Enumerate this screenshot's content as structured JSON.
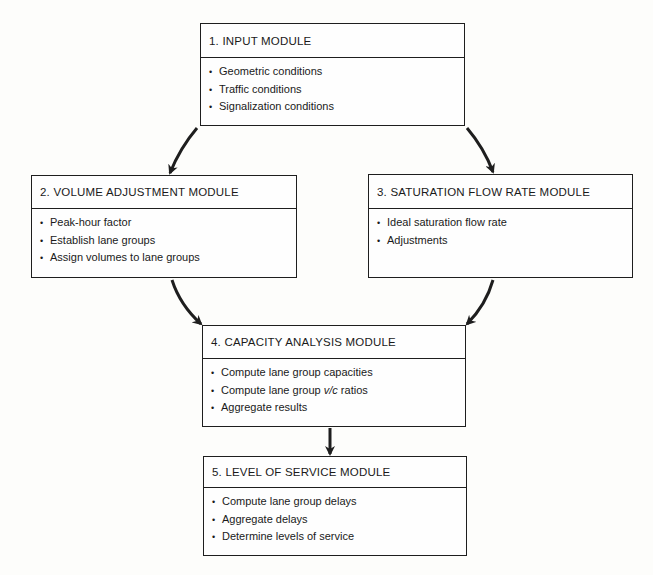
{
  "diagram": {
    "modules": [
      {
        "id": "input",
        "title": "1. INPUT MODULE",
        "items": [
          "Geometric conditions",
          "Traffic conditions",
          "Signalization conditions"
        ]
      },
      {
        "id": "volume-adjustment",
        "title": "2. VOLUME ADJUSTMENT MODULE",
        "items": [
          "Peak-hour factor",
          "Establish lane groups",
          "Assign volumes to lane groups"
        ]
      },
      {
        "id": "saturation-flow-rate",
        "title": "3. SATURATION FLOW RATE MODULE",
        "items": [
          "Ideal saturation flow rate",
          "Adjustments"
        ]
      },
      {
        "id": "capacity-analysis",
        "title": "4. CAPACITY ANALYSIS MODULE",
        "items": [
          "Compute lane group capacities",
          "Compute lane group v/c ratios",
          "Aggregate results"
        ]
      },
      {
        "id": "level-of-service",
        "title": "5. LEVEL OF SERVICE MODULE",
        "items": [
          "Compute lane group delays",
          "Aggregate delays",
          "Determine levels of service"
        ]
      }
    ],
    "edges": [
      {
        "from": "input",
        "to": "volume-adjustment"
      },
      {
        "from": "input",
        "to": "saturation-flow-rate"
      },
      {
        "from": "volume-adjustment",
        "to": "capacity-analysis"
      },
      {
        "from": "saturation-flow-rate",
        "to": "capacity-analysis"
      },
      {
        "from": "capacity-analysis",
        "to": "level-of-service"
      }
    ],
    "bullet_glyph": "•",
    "colors": {
      "line": "#1e1e1e",
      "background": "#fdfdfb"
    }
  }
}
